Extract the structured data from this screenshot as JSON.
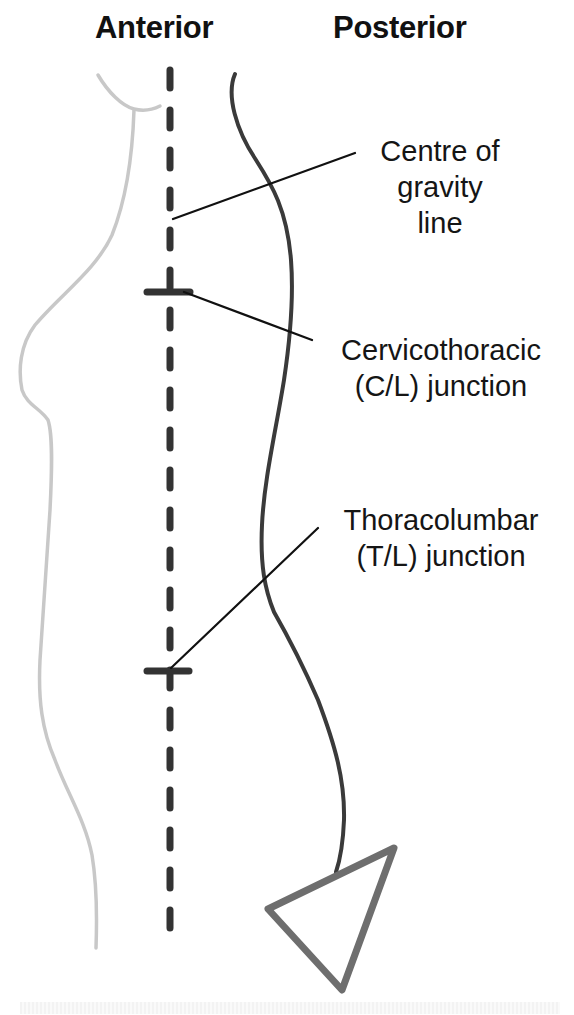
{
  "headings": {
    "anterior": "Anterior",
    "posterior": "Posterior"
  },
  "labels": {
    "gravity_line": [
      "Centre of",
      "gravity",
      "line"
    ],
    "cervicothoracic": [
      "Cervicothoracic",
      "(C/L) junction"
    ],
    "thoracolumbar": [
      "Thoracolumbar",
      "(T/L) junction"
    ]
  },
  "colors": {
    "body_outline": "#c8c8c8",
    "spine_line": "#3a3a3a",
    "gravity_dashes": "#333333",
    "leader_lines": "#111111",
    "pelvis_triangle": "#6e6e6e",
    "text": "#151515"
  },
  "elements": {
    "body_outline": "Anterior body silhouette (light gray)",
    "spine_curve": "Posterior spinal curve",
    "gravity_line": "Vertical dashed centre of gravity line",
    "cervicothoracic_marker": "Horizontal tick at C/L junction",
    "thoracolumbar_marker": "Horizontal tick at T/L junction",
    "pelvis_triangle": "Sacrum/pelvis triangle"
  }
}
